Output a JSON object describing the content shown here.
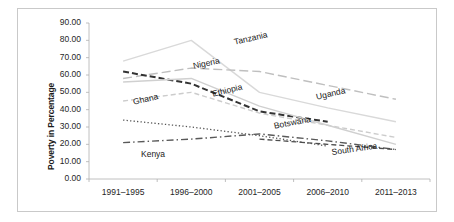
{
  "chart_data": {
    "type": "line",
    "title": "",
    "xlabel": "",
    "ylabel": "Poverty in Percentage",
    "categories": [
      "1991–1995",
      "1996–2000",
      "2001–2005",
      "2006–2010",
      "2011–2013"
    ],
    "ylim": [
      0,
      90
    ],
    "ytick_labels": [
      "90.00",
      "80.00",
      "70.00",
      "60.00",
      "50.00",
      "40.00",
      "30.00",
      "20.00",
      "10.00",
      "0.00"
    ],
    "ytick_values": [
      90,
      80,
      70,
      60,
      50,
      40,
      30,
      20,
      10,
      0
    ],
    "grid": false,
    "legend": "inline-labels",
    "series": [
      {
        "name": "Tanzania",
        "style": "solid",
        "color": "#d9d9d9",
        "width": 1.4,
        "values": [
          68.0,
          80.0,
          50.0,
          41.0,
          33.0
        ],
        "label_x": 232,
        "label_y": 36,
        "label_rotate": -13
      },
      {
        "name": "Nigeria",
        "style": "longdash",
        "color": "#bfbfbf",
        "width": 1.4,
        "values": [
          58.0,
          64.0,
          62.0,
          54.0,
          46.0
        ],
        "label_x": 191,
        "label_y": 60,
        "label_rotate": -12
      },
      {
        "name": "Ghana",
        "style": "dash",
        "color": "#cccccc",
        "width": 1.4,
        "values": [
          45.0,
          50.0,
          38.0,
          31.0,
          24.0
        ],
        "label_x": 131,
        "label_y": 96,
        "label_rotate": -13
      },
      {
        "name": "Ethiopia",
        "style": "bolddash",
        "color": "#333333",
        "width": 2.0,
        "values": [
          62.0,
          55.0,
          39.0,
          33.0,
          null
        ],
        "label_x": 210,
        "label_y": 88,
        "label_rotate": -14
      },
      {
        "name": "Uganda",
        "style": "solid",
        "color": "#d0d0d0",
        "width": 1.4,
        "values": [
          56.0,
          58.0,
          42.0,
          31.0,
          20.0
        ],
        "label_x": 314,
        "label_y": 91,
        "label_rotate": -13
      },
      {
        "name": "Botswana",
        "style": "dot",
        "color": "#555555",
        "width": 1.3,
        "values": [
          34.0,
          30.0,
          25.0,
          19.0,
          null
        ],
        "label_x": 272,
        "label_y": 120,
        "label_rotate": -11
      },
      {
        "name": "Kenya",
        "style": "dashdot",
        "color": "#595959",
        "width": 1.4,
        "values": [
          21.0,
          23.0,
          26.0,
          22.0,
          17.0
        ],
        "label_x": 140,
        "label_y": 148,
        "label_rotate": 0
      },
      {
        "name": "South Africa",
        "style": "dash",
        "color": "#4d4d4d",
        "width": 1.3,
        "values": [
          null,
          null,
          23.0,
          20.0,
          17.0
        ],
        "label_x": 330,
        "label_y": 146,
        "label_rotate": -8
      }
    ]
  }
}
